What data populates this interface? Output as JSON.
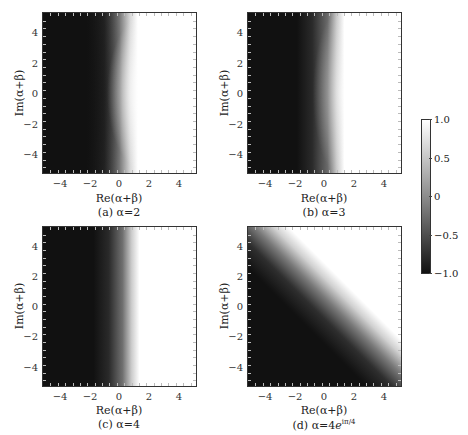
{
  "chart_data": [
    {
      "type": "heatmap",
      "panel": "a",
      "caption": "(a) α=2",
      "xlabel": "Re(α+β)",
      "ylabel": "Im(α+β)",
      "xlim": [
        -5.2,
        5.2
      ],
      "ylim": [
        -5.2,
        5.2
      ],
      "xticks": [
        -4,
        -2,
        0,
        2,
        4
      ],
      "yticks": [
        -4,
        -2,
        0,
        2,
        4
      ],
      "description": "Dark (-1) region on left, transition to white (+1) around Re≈0.5–1; boundary bulges outward (hyperbola-like), transition further right at |Im|≈5 (~Re 2) than at Im=0 (~Re 0.8)"
    },
    {
      "type": "heatmap",
      "panel": "b",
      "caption": "(b) α=3",
      "xlabel": "Re(α+β)",
      "ylabel": "Im(α+β)",
      "xlim": [
        -5.2,
        5.2
      ],
      "ylim": [
        -5.2,
        5.2
      ],
      "xticks": [
        -4,
        -2,
        0,
        2,
        4
      ],
      "yticks": [
        -4,
        -2,
        0,
        2,
        4
      ],
      "description": "Dark region left, transition to white near Re≈0.5–1.5, slightly curved boundary"
    },
    {
      "type": "heatmap",
      "panel": "c",
      "caption": "(c) α=4",
      "xlabel": "Re(α+β)",
      "ylabel": "Im(α+β)",
      "xlim": [
        -5.2,
        5.2
      ],
      "ylim": [
        -5.2,
        5.2
      ],
      "xticks": [
        -4,
        -2,
        0,
        2,
        4
      ],
      "yticks": [
        -4,
        -2,
        0,
        2,
        4
      ],
      "description": "Dark region left, nearly vertical transition to white near Re≈0.5–1.5"
    },
    {
      "type": "heatmap",
      "panel": "d",
      "caption": "(d) α=4e^{iπ/4}",
      "xlabel": "Re(α+β)",
      "ylabel": "Im(α+β)",
      "xlim": [
        -5.2,
        5.2
      ],
      "ylim": [
        -5.2,
        5.2
      ],
      "xticks": [
        -4,
        -2,
        0,
        2,
        4
      ],
      "yticks": [
        -4,
        -2,
        0,
        2,
        4
      ],
      "description": "Diagonal boundary from upper-left to lower-right (Re+Im≈0); dark below-left, white above-right"
    }
  ],
  "colorbar": {
    "range": [
      -1.0,
      1.0
    ],
    "ticks": [
      "1.0",
      "0.5",
      "0",
      "−0.5",
      "−1.0"
    ],
    "colormap": "grayscale (black=-1, white=1)"
  },
  "panels": {
    "a": {
      "caption": "(a) α=2",
      "xlabel": "Re(α+β)",
      "ylabel": "Im(α+β)"
    },
    "b": {
      "caption": "(b) α=3",
      "xlabel": "Re(α+β)",
      "ylabel": "Im(α+β)"
    },
    "c": {
      "caption": "(c) α=4",
      "xlabel": "Re(α+β)",
      "ylabel": "Im(α+β)"
    },
    "d": {
      "caption_prefix": "(d) α=4",
      "caption_base": "e",
      "caption_sup": "iπ/4",
      "xlabel": "Re(α+β)",
      "ylabel": "Im(α+β)"
    }
  },
  "ticks": {
    "x": [
      "−4",
      "−2",
      "0",
      "2",
      "4"
    ],
    "y": [
      "4",
      "2",
      "0",
      "−2",
      "−4"
    ]
  }
}
